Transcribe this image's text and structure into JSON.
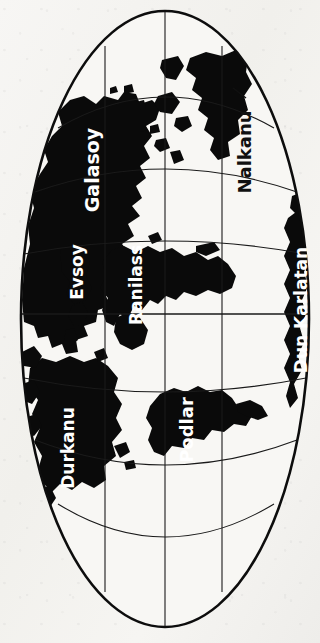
{
  "map": {
    "title": "World Map",
    "projection": "Mollweide oval (rotated 90°)",
    "orientation": "landscape-rotated",
    "background_color": "#f4f3f0",
    "land_color": "#0a0a0a",
    "ocean_color": "#f7f6f3",
    "graticule_color": "#1a1a1a",
    "outline_color": "#0d0d0d",
    "labels": [
      {
        "id": "galasoy",
        "name": "Galasoy",
        "color": "#ffffff",
        "on_land": true,
        "x": 92,
        "y": 170,
        "rotation": -90,
        "font_size": 19
      },
      {
        "id": "evsoy",
        "name": "Evsoy",
        "color": "#ffffff",
        "on_land": true,
        "x": 77,
        "y": 272,
        "rotation": -90,
        "font_size": 17
      },
      {
        "id": "ranilass",
        "name": "Ranilass",
        "color": "#ffffff",
        "on_land": true,
        "x": 136,
        "y": 285,
        "rotation": -90,
        "font_size": 17
      },
      {
        "id": "nalkanu",
        "name": "Nalkanu",
        "color": "#111111",
        "on_land": false,
        "x": 244,
        "y": 152,
        "rotation": -90,
        "font_size": 18
      },
      {
        "id": "dun-karlatan",
        "name": "Dun Karlatan",
        "color": "#ffffff",
        "on_land": true,
        "x": 301,
        "y": 310,
        "rotation": -90,
        "font_size": 17
      },
      {
        "id": "durkanu",
        "name": "Durkanu",
        "color": "#ffffff",
        "on_land": true,
        "x": 68,
        "y": 448,
        "rotation": -90,
        "font_size": 17
      },
      {
        "id": "podlar",
        "name": "Podlar",
        "color": "#ffffff",
        "on_land": true,
        "x": 186,
        "y": 430,
        "rotation": -90,
        "font_size": 18
      }
    ],
    "graticule": {
      "parallels_x": [
        105,
        165,
        222
      ],
      "equator_y": 314,
      "meridian_count": 7,
      "grid_visible": true
    },
    "oval": {
      "cx": 165,
      "cy": 319,
      "rx": 145,
      "ry": 309
    }
  }
}
